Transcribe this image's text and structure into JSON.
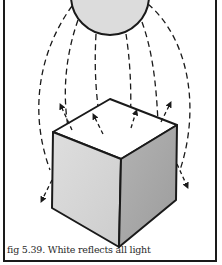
{
  "figure": {
    "caption": "fig 5.39. White reflects all light",
    "colors": {
      "outline": "#1a1a1a",
      "sphere_fill": "#dcdcdc",
      "cube_top": "#ffffff",
      "cube_left": "#d6d6d6",
      "cube_right": "#a9a9a9",
      "background": "#ffffff"
    },
    "elements": [
      {
        "name": "light-source",
        "shape": "sphere"
      },
      {
        "name": "incoming-light-rays",
        "style": "dashed"
      },
      {
        "name": "reflected-light-arrows",
        "style": "dashed with arrowheads"
      },
      {
        "name": "cube",
        "shape": "cube"
      }
    ]
  }
}
